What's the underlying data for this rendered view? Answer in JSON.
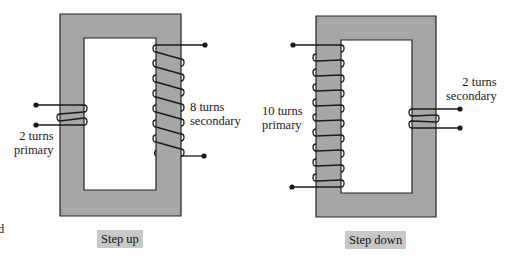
{
  "colors": {
    "core_fill": "#a6a6a6",
    "core_stroke": "#222222",
    "wire": "#1a1a1a",
    "caption_bg": "#c8c8c8"
  },
  "step_up": {
    "caption": "Step up",
    "primary": {
      "turns": 2,
      "label_line1": "2 turns",
      "label_line2": "primary"
    },
    "secondary": {
      "turns": 8,
      "label_line1": "8 turns",
      "label_line2": "secondary"
    }
  },
  "step_down": {
    "caption": "Step down",
    "primary": {
      "turns": 10,
      "label_line1": "10 turns",
      "label_line2": "primary"
    },
    "secondary": {
      "turns": 2,
      "label_line1": "2 turns",
      "label_line2": "secondary"
    }
  },
  "edge_fragment": "d"
}
